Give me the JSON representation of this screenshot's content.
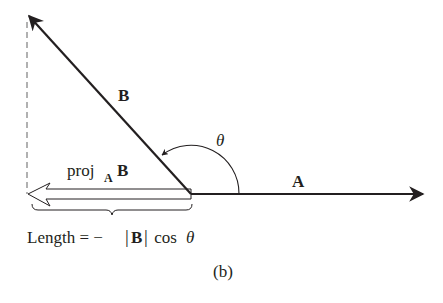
{
  "figure": {
    "caption": "(b)",
    "colors": {
      "ink": "#231f20",
      "dashed": "#888888",
      "background": "#ffffff"
    }
  },
  "vectors": {
    "A": {
      "label": "A",
      "origin": [
        191,
        194
      ],
      "tip": [
        423,
        194
      ]
    },
    "B": {
      "label": "B",
      "origin": [
        191,
        194
      ],
      "tip": [
        27,
        14
      ]
    },
    "projection": {
      "label_main": "proj",
      "label_sub": "A",
      "label_vec": "B",
      "origin": [
        191,
        194
      ],
      "tip": [
        28,
        194
      ],
      "style": "hollow"
    }
  },
  "angle": {
    "label": "θ"
  },
  "dashed_drop": {
    "x": 27,
    "from_y": 22,
    "to_y": 194
  },
  "length_formula": {
    "prefix": "Length = −",
    "bar_left": "|",
    "vec": "B",
    "bar_right": "|",
    "suffix": " cos ",
    "theta": "θ"
  }
}
